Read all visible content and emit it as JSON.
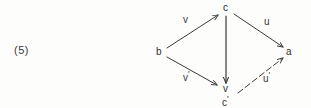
{
  "figure": {
    "number_label": "(5)"
  },
  "diagram": {
    "type": "commutative-diagram",
    "ink_color": "#3a3a3a",
    "background_color": "#fdfdfc",
    "nodes": [
      {
        "id": "c",
        "label": "c",
        "prime": "",
        "x": 226,
        "y": 8
      },
      {
        "id": "b",
        "label": "b",
        "prime": "",
        "x": 159,
        "y": 52
      },
      {
        "id": "a",
        "label": "a",
        "prime": "",
        "x": 289,
        "y": 52
      },
      {
        "id": "v",
        "label": "v",
        "prime": "",
        "x": 226,
        "y": 89
      },
      {
        "id": "c-prime",
        "label": "c",
        "prime": "'",
        "x": 226,
        "y": 100
      }
    ],
    "edges": [
      {
        "id": "b-to-c",
        "from": "b",
        "to": "c",
        "label": "v",
        "prime": "",
        "style": "solid",
        "label_x": 185,
        "label_y": 20
      },
      {
        "id": "c-to-a",
        "from": "c",
        "to": "a",
        "label": "u",
        "prime": "",
        "style": "solid",
        "label_x": 266,
        "label_y": 22
      },
      {
        "id": "b-to-v",
        "from": "b",
        "to": "v",
        "label": "v",
        "prime": "'",
        "style": "solid",
        "label_x": 185,
        "label_y": 75
      },
      {
        "id": "c-to-v",
        "from": "c",
        "to": "v",
        "label": "",
        "prime": "",
        "style": "solid",
        "label_x": 0,
        "label_y": 0
      },
      {
        "id": "cprime-to-a",
        "from": "c-prime",
        "to": "a",
        "label": "u",
        "prime": "'",
        "style": "dashed",
        "label_x": 265,
        "label_y": 76
      }
    ]
  }
}
